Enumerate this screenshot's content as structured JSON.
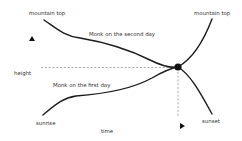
{
  "diagram": {
    "labels": {
      "mountain_top_left": "mountain top",
      "mountain_top_right": "mountain top",
      "second_day": "Monk on the second  day",
      "first_day": "Monk on the first day",
      "height_axis": "height",
      "time_axis": "time",
      "sunrise": "sunrise",
      "sunset": "sunset"
    },
    "colors": {
      "curve": "#1a1a1a",
      "dashed": "#888888",
      "text": "#333333",
      "background": "#ffffff"
    },
    "curves": [
      {
        "name": "Monk on the second day",
        "direction": "descending",
        "from": "mountain top",
        "to": "sunset"
      },
      {
        "name": "Monk on the first day",
        "direction": "ascending",
        "from": "sunrise",
        "to": "mountain top"
      }
    ],
    "intersection": {
      "marker": "filled-dot"
    }
  }
}
